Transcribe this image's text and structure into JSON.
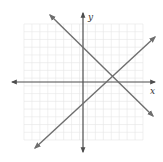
{
  "graph": {
    "x_axis_label": "x",
    "y_axis_label": "y",
    "grid": {
      "cells_x": 15,
      "cells_y": 15,
      "origin_cell_x": 7,
      "origin_cell_y": 7
    },
    "colors": {
      "grid": "#e6e6e6",
      "axis": "#4d4d4d",
      "lines": "#6e6e6e",
      "background": "#ffffff"
    },
    "lines": [
      {
        "name": "decreasing-line",
        "slope": -1,
        "y_intercept": 4,
        "description": "line sloping down from upper-left to lower-right"
      },
      {
        "name": "increasing-line",
        "slope": 1,
        "y_intercept": -3,
        "description": "line sloping up from lower-left to upper-right"
      }
    ],
    "intersection_approx": {
      "x": 3.5,
      "y": 0.5
    }
  }
}
